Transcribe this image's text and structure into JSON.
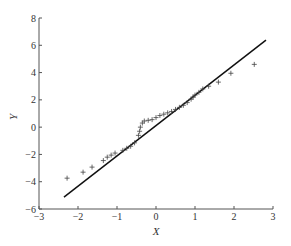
{
  "chart_data": {
    "type": "scatter",
    "title": "",
    "xlabel": "X",
    "ylabel": "Y",
    "xlim": [
      -3,
      3
    ],
    "ylim": [
      -6,
      8
    ],
    "xticks": [
      -3,
      -2,
      -1,
      0,
      1,
      2,
      3
    ],
    "yticks": [
      -6,
      -4,
      -2,
      0,
      2,
      4,
      6,
      8
    ],
    "grid": false,
    "legend": null,
    "marker": "+",
    "series": [
      {
        "name": "data points",
        "type": "scatter",
        "points": [
          [
            -2.28,
            -3.74
          ],
          [
            -1.87,
            -3.3
          ],
          [
            -1.64,
            -2.93
          ],
          [
            -1.35,
            -2.45
          ],
          [
            -1.25,
            -2.2
          ],
          [
            -1.15,
            -2.05
          ],
          [
            -1.05,
            -1.9
          ],
          [
            -0.85,
            -1.7
          ],
          [
            -0.75,
            -1.55
          ],
          [
            -0.65,
            -1.4
          ],
          [
            -0.55,
            -1.15
          ],
          [
            -0.45,
            -0.6
          ],
          [
            -0.42,
            -0.3
          ],
          [
            -0.4,
            0.0
          ],
          [
            -0.35,
            0.3
          ],
          [
            -0.3,
            0.45
          ],
          [
            -0.2,
            0.5
          ],
          [
            -0.1,
            0.55
          ],
          [
            0.0,
            0.7
          ],
          [
            0.1,
            0.85
          ],
          [
            0.2,
            0.95
          ],
          [
            0.3,
            1.05
          ],
          [
            0.4,
            1.15
          ],
          [
            0.5,
            1.3
          ],
          [
            0.6,
            1.45
          ],
          [
            0.7,
            1.6
          ],
          [
            0.8,
            1.8
          ],
          [
            0.9,
            2.05
          ],
          [
            0.95,
            2.2
          ],
          [
            1.0,
            2.35
          ],
          [
            1.1,
            2.55
          ],
          [
            1.2,
            2.8
          ],
          [
            1.35,
            3.0
          ],
          [
            1.6,
            3.3
          ],
          [
            1.92,
            3.95
          ],
          [
            2.52,
            4.6
          ]
        ]
      },
      {
        "name": "reference line",
        "type": "line",
        "points": [
          [
            -2.36,
            -5.13
          ],
          [
            2.82,
            6.38
          ]
        ]
      }
    ]
  }
}
